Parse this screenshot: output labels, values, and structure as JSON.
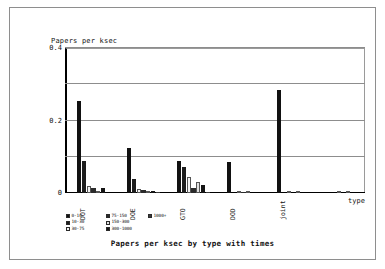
{
  "chart_data": {
    "type": "bar",
    "title": "Papers per ksec by type with times",
    "ylabel": "Papers per ksec",
    "xlabel": "type",
    "ylim": [
      0,
      0.4
    ],
    "yticks": [
      "0.4",
      "0.2",
      "0"
    ],
    "ytick_values": [
      0.4,
      0.2,
      0
    ],
    "gridlines": [
      0.4,
      0.3,
      0.2,
      0.1,
      0
    ],
    "grid": true,
    "legend_position": "bottom-left",
    "categories": [
      "DOT",
      "DOE",
      "GTO",
      "DOD",
      "joint",
      ""
    ],
    "series": [
      {
        "name": "0-10",
        "color": "#111111",
        "values": [
          0.255,
          0.125,
          0.088,
          0.085,
          0.285,
          0.0
        ]
      },
      {
        "name": "10-30",
        "color": "#1d1d1d",
        "values": [
          0.088,
          0.04,
          0.073,
          0.0,
          0.0,
          0.0
        ]
      },
      {
        "name": "30-75",
        "color": "#f2f2f2",
        "values": [
          0.02,
          0.011,
          0.045,
          0.004,
          0.006,
          0.0
        ]
      },
      {
        "name": "75-150",
        "color": "#2a2a2a",
        "values": [
          0.013,
          0.007,
          0.014,
          0.002,
          0.0,
          0.0
        ]
      },
      {
        "name": "150-300",
        "color": "#e0e0e0",
        "values": [
          0.0,
          0.0,
          0.031,
          0.0,
          0.0,
          0.0
        ]
      },
      {
        "name": "300-1000",
        "color": "#151515",
        "values": [
          0.013,
          0.006,
          0.022,
          0.0,
          0.0,
          0.0
        ]
      },
      {
        "name": "1000+",
        "color": "#3a3a3a",
        "values": [
          0.0,
          0.002,
          0.002,
          0.0,
          0.0,
          0.0
        ]
      }
    ],
    "legend_entries": [
      {
        "label": "0-10",
        "color": "#111111"
      },
      {
        "label": "75-150",
        "color": "#2a2a2a"
      },
      {
        "label": "1000+",
        "color": "#3a3a3a"
      },
      {
        "label": "10-30",
        "color": "#1d1d1d"
      },
      {
        "label": "150-300",
        "color": "#e0e0e0"
      },
      {
        "label": "",
        "color": ""
      },
      {
        "label": "30-75",
        "color": "#f2f2f2"
      },
      {
        "label": "300-1000",
        "color": "#151515"
      },
      {
        "label": "",
        "color": ""
      }
    ]
  }
}
